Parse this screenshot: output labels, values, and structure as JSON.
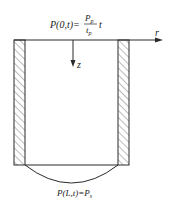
{
  "diagram": {
    "top_boundary_condition": {
      "lhs": "P(0,t)=",
      "numerator": "P",
      "numerator_sub": "p",
      "denominator": "t",
      "denominator_sub": "p",
      "trailing": "t"
    },
    "bottom_boundary_condition": {
      "lhs": "P(L,t)=",
      "rhs": "P",
      "rhs_sub": "s"
    },
    "axes": {
      "r_label": "r",
      "z_label": "z"
    },
    "colors": {
      "line": "#2a2a2a",
      "hatch": "#555555"
    }
  }
}
